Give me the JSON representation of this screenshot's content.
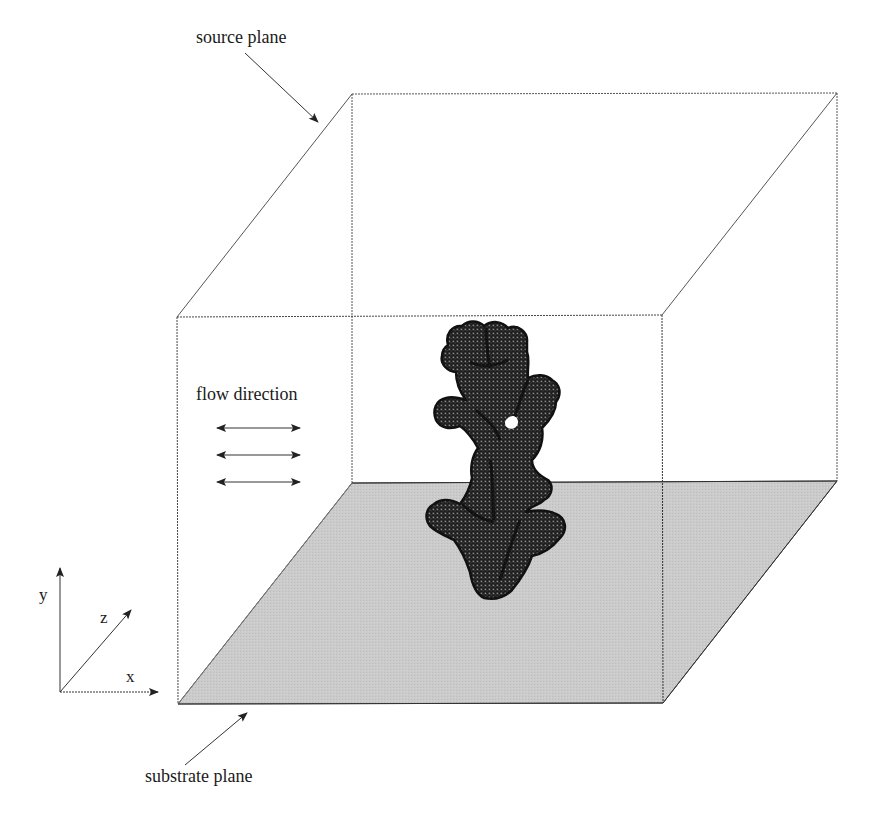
{
  "figure": {
    "type": "3D simulation domain schematic",
    "labels": {
      "source_plane": "source plane",
      "flow_direction": "flow direction",
      "substrate_plane": "substrate plane"
    },
    "axes": {
      "x": "x",
      "y": "y",
      "z": "z"
    },
    "flow_arrows": {
      "count": 3,
      "style": "double-headed horizontal"
    },
    "colors": {
      "background": "#ffffff",
      "box_edges": "#555555",
      "substrate_fill": "#c8c8c8",
      "object_fill": "#2a2a2a",
      "text": "#1a1a1a"
    },
    "box": {
      "front_top_left": [
        177,
        317
      ],
      "front_top_right": [
        662,
        315
      ],
      "front_bottom_left": [
        178,
        704
      ],
      "front_bottom_right": [
        663,
        703
      ],
      "back_top_left": [
        352,
        94
      ],
      "back_top_right": [
        837,
        93
      ],
      "back_bottom_left": [
        352,
        483
      ],
      "back_bottom_right": [
        837,
        481
      ]
    },
    "object": {
      "description": "voxelized dendritic/coral-like deposit grown from substrate",
      "approx_bounds": {
        "x_min": 425,
        "x_max": 565,
        "y_min": 320,
        "y_max": 600
      }
    }
  }
}
